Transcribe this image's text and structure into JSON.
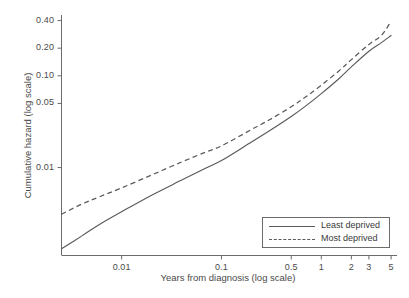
{
  "chart_data": {
    "type": "line",
    "title": "",
    "xlabel": "Years from diagnosis (log scale)",
    "ylabel": "Cumulative hazard (log scale)",
    "xscale": "log",
    "yscale": "log",
    "xlim": [
      0.0025,
      5.6
    ],
    "ylim": [
      0.0011,
      0.46
    ],
    "grid": false,
    "legend_position": "bottom-right",
    "xticks": [
      0.01,
      0.1,
      0.5,
      1,
      2,
      3,
      5
    ],
    "xticklabels": [
      "0.01",
      "0.1",
      "0.5",
      "1",
      "2",
      "3",
      "5"
    ],
    "yticks": [
      0.01,
      0.05,
      0.1,
      0.2,
      0.4
    ],
    "yticklabels": [
      "0.01",
      "0.05",
      "0.10",
      "0.20",
      "0.40"
    ],
    "x": [
      0.0025,
      0.004,
      0.006,
      0.01,
      0.02,
      0.04,
      0.07,
      0.1,
      0.2,
      0.3,
      0.5,
      0.7,
      1.0,
      1.5,
      2.0,
      3.0,
      4.0,
      5.0
    ],
    "series": [
      {
        "name": "Least deprived",
        "style": "solid",
        "color": "#5a5a5a",
        "values": [
          0.0013,
          0.0018,
          0.0024,
          0.0033,
          0.005,
          0.0073,
          0.0099,
          0.0119,
          0.019,
          0.025,
          0.036,
          0.047,
          0.064,
          0.093,
          0.125,
          0.185,
          0.23,
          0.275
        ]
      },
      {
        "name": "Most deprived",
        "style": "dashed",
        "color": "#5a5a5a",
        "values": [
          0.0031,
          0.004,
          0.0048,
          0.006,
          0.0083,
          0.0115,
          0.0148,
          0.0172,
          0.026,
          0.033,
          0.046,
          0.059,
          0.079,
          0.113,
          0.15,
          0.22,
          0.275,
          0.395
        ]
      }
    ]
  },
  "legend": {
    "entries": [
      {
        "label": "Least deprived",
        "style": "solid"
      },
      {
        "label": "Most deprived",
        "style": "dashed"
      }
    ]
  },
  "axis_color": "#6b6b6b"
}
